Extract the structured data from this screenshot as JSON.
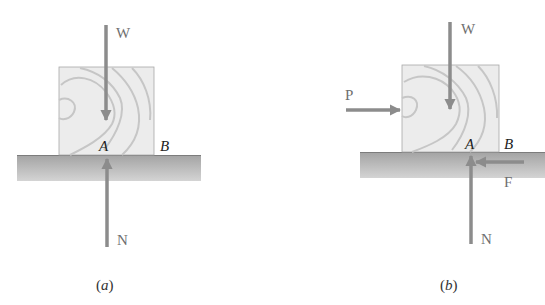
{
  "figure": {
    "colors": {
      "arrow": "#8c8c8c",
      "ground_top": "#9a9a9a",
      "ground_bottom": "#d2d2d2",
      "block_fill": "#eaeaea",
      "block_grain": "#c9c9c9",
      "force_label": "#6f6f6f",
      "point_label": "#222222"
    },
    "panels": [
      {
        "id": "a",
        "caption_open": "(",
        "caption_letter": "a",
        "caption_close": ")",
        "forces": [
          {
            "label": "W",
            "direction": "down"
          },
          {
            "label": "N",
            "direction": "up"
          }
        ],
        "points": [
          "A",
          "B"
        ]
      },
      {
        "id": "b",
        "caption_open": "(",
        "caption_letter": "b",
        "caption_close": ")",
        "forces": [
          {
            "label": "W",
            "direction": "down"
          },
          {
            "label": "P",
            "direction": "right"
          },
          {
            "label": "F",
            "direction": "left"
          },
          {
            "label": "N",
            "direction": "up"
          }
        ],
        "points": [
          "A",
          "B"
        ]
      }
    ]
  }
}
